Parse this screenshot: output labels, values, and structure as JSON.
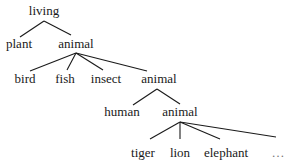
{
  "diagram": {
    "type": "tree",
    "nodes": {
      "root": "living",
      "l1_left": "plant",
      "l1_right": "animal",
      "l2_a": "bird",
      "l2_b": "fish",
      "l2_c": "insect",
      "l2_d": "animal",
      "l3_a": "human",
      "l3_b": "animal",
      "l4_a": "tiger",
      "l4_b": "lion",
      "l4_c": "elephant",
      "l4_d": "…"
    },
    "edges": [
      [
        "living",
        "plant"
      ],
      [
        "living",
        "animal"
      ],
      [
        "animal",
        "bird"
      ],
      [
        "animal",
        "fish"
      ],
      [
        "animal",
        "insect"
      ],
      [
        "animal",
        "animal"
      ],
      [
        "animal",
        "human"
      ],
      [
        "animal",
        "animal"
      ],
      [
        "animal",
        "tiger"
      ],
      [
        "animal",
        "lion"
      ],
      [
        "animal",
        "elephant"
      ],
      [
        "animal",
        "…"
      ]
    ],
    "colors": {
      "ink": "#1a1a1a",
      "background": "#ffffff"
    }
  }
}
